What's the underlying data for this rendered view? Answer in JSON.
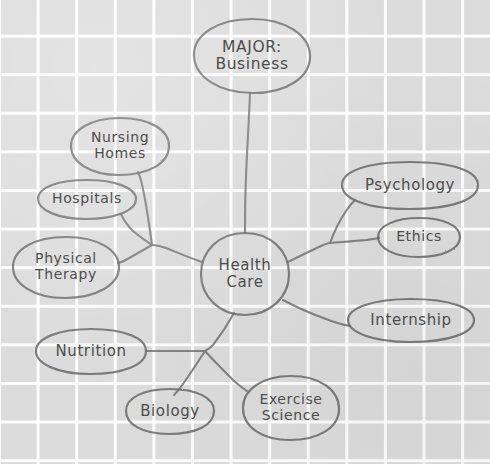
{
  "diagram": {
    "title_node": "MAJOR: Business",
    "center_node": "Health Care",
    "ink_color": "#6b6b6b",
    "paper_color": "#dcdcdc",
    "grid_line_color": "#ffffff",
    "nodes": [
      {
        "id": "major",
        "label": "MAJOR:\nBusiness",
        "cx": 252,
        "cy": 56,
        "rx": 58,
        "ry": 37,
        "font_size": 15.5
      },
      {
        "id": "nursing-homes",
        "label": "Nursing\nHomes",
        "cx": 120,
        "cy": 146,
        "rx": 49,
        "ry": 28,
        "font_size": 14
      },
      {
        "id": "hospitals",
        "label": "Hospitals",
        "cx": 87,
        "cy": 199,
        "rx": 49,
        "ry": 19,
        "font_size": 14
      },
      {
        "id": "physical-therapy",
        "label": "Physical\nTherapy",
        "cx": 66,
        "cy": 267,
        "rx": 53,
        "ry": 30,
        "font_size": 14
      },
      {
        "id": "nutrition",
        "label": "Nutrition",
        "cx": 91,
        "cy": 351,
        "rx": 55,
        "ry": 22,
        "font_size": 15
      },
      {
        "id": "biology",
        "label": "Biology",
        "cx": 170,
        "cy": 411,
        "rx": 44,
        "ry": 22,
        "font_size": 15
      },
      {
        "id": "exercise-science",
        "label": "Exercise\nScience",
        "cx": 291,
        "cy": 408,
        "rx": 48,
        "ry": 32,
        "font_size": 14
      },
      {
        "id": "health-care",
        "label": "Health\nCare",
        "cx": 245,
        "cy": 274,
        "rx": 44,
        "ry": 41,
        "font_size": 15
      },
      {
        "id": "psychology",
        "label": "Psychology",
        "cx": 410,
        "cy": 185,
        "rx": 68,
        "ry": 23,
        "font_size": 15
      },
      {
        "id": "ethics",
        "label": "Ethics",
        "cx": 419,
        "cy": 237,
        "rx": 41,
        "ry": 19,
        "font_size": 14
      },
      {
        "id": "internship",
        "label": "Internship",
        "cx": 411,
        "cy": 320,
        "rx": 63,
        "ry": 21,
        "font_size": 15
      }
    ],
    "connectors": [
      {
        "id": "major-to-health-care",
        "from": "major",
        "to": "health-care"
      },
      {
        "id": "health-care-to-left-hub",
        "from": "health-care",
        "to": "left-hub"
      },
      {
        "id": "left-hub-to-nursing-homes",
        "from": "left-hub",
        "to": "nursing-homes"
      },
      {
        "id": "left-hub-to-hospitals",
        "from": "left-hub",
        "to": "hospitals"
      },
      {
        "id": "left-hub-to-physical-therapy",
        "from": "left-hub",
        "to": "physical-therapy"
      },
      {
        "id": "health-care-to-bottom-hub",
        "from": "health-care",
        "to": "bottom-hub"
      },
      {
        "id": "bottom-hub-to-nutrition",
        "from": "bottom-hub",
        "to": "nutrition"
      },
      {
        "id": "bottom-hub-to-biology",
        "from": "bottom-hub",
        "to": "biology"
      },
      {
        "id": "bottom-hub-to-exercise",
        "from": "bottom-hub",
        "to": "exercise-science"
      },
      {
        "id": "health-care-to-right-hub",
        "from": "health-care",
        "to": "right-hub"
      },
      {
        "id": "right-hub-to-psychology",
        "from": "right-hub",
        "to": "psychology"
      },
      {
        "id": "right-hub-to-ethics",
        "from": "right-hub",
        "to": "ethics"
      },
      {
        "id": "health-care-to-internship",
        "from": "health-care",
        "to": "internship"
      }
    ]
  }
}
